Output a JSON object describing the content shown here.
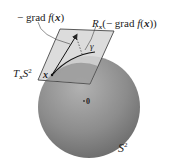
{
  "figure": {
    "labels": {
      "neg_grad": {
        "minus": "−",
        "grad": "grad",
        "f": "f",
        "open": "(",
        "x": "x",
        "close": ")"
      },
      "retraction": {
        "R": "R",
        "sub": "x",
        "open": "(−",
        "grad": "grad",
        "f": "f",
        "paren_open": "(",
        "x": "x",
        "close": "))"
      },
      "tangent_space": {
        "T": "T",
        "sub": "x",
        "S": "S",
        "sup": "2"
      },
      "gamma": "γ",
      "point_x": "x",
      "origin": "0",
      "sphere": {
        "S": "S",
        "sup": "2"
      }
    },
    "colors": {
      "sphere_light": "#b4b4b4",
      "sphere_mid": "#8a8a8a",
      "sphere_dark": "#5e5e5e",
      "plane_fill": "#d4d4d4",
      "plane_edge": "#333333",
      "ink": "#222222"
    }
  }
}
